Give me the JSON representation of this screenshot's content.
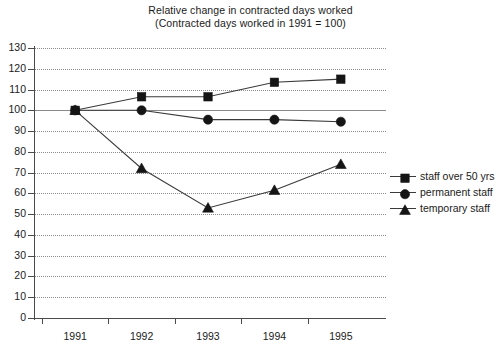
{
  "chart_data": {
    "type": "line",
    "title": "Relative change in contracted days worked",
    "subtitle": "(Contracted days worked in 1991 = 100)",
    "xlabel": "",
    "ylabel": "",
    "categories": [
      "1991",
      "1992",
      "1993",
      "1994",
      "1995"
    ],
    "x": [
      1991,
      1992,
      1993,
      1994,
      1995
    ],
    "ylim": [
      0,
      130
    ],
    "yticks": [
      0,
      10,
      20,
      30,
      40,
      50,
      60,
      70,
      80,
      90,
      100,
      110,
      120,
      130
    ],
    "ytick_labels": [
      "0",
      "10",
      "20",
      "30",
      "40",
      "50",
      "60",
      "70",
      "80",
      "90",
      "100",
      "110",
      "120",
      "130"
    ],
    "grid": true,
    "grid_style": "dotted",
    "reference_line": 100,
    "legend_position": "right",
    "series": [
      {
        "name": "staff over 50 yrs",
        "marker": "square",
        "values": [
          100,
          106.5,
          106.5,
          113.5,
          115
        ]
      },
      {
        "name": "permanent staff",
        "marker": "circle",
        "values": [
          100,
          100,
          95.5,
          95.5,
          94.5
        ]
      },
      {
        "name": "temporary staff",
        "marker": "triangle",
        "values": [
          100,
          72,
          53,
          61.5,
          74
        ]
      }
    ],
    "colors": {
      "line": "#3a3a3a",
      "marker": "#151515",
      "grid": "#8d8d8d",
      "axis": "#4a4a4a",
      "text": "#1b1b1b",
      "background": "#ffffff"
    }
  }
}
